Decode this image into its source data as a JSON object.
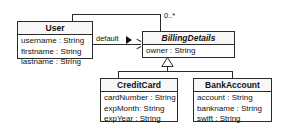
{
  "diagram": {
    "type": "uml-class-diagram",
    "background": "#ffffff",
    "line_color": "#2b2b2b",
    "classes": [
      {
        "id": "user",
        "name": "User",
        "abstract": false,
        "attributes": [
          "username : String",
          "firstname : String",
          "lastname : String"
        ]
      },
      {
        "id": "billingdetails",
        "name": "BillingDetails",
        "abstract": true,
        "attributes": [
          "owner : String"
        ]
      },
      {
        "id": "creditcard",
        "name": "CreditCard",
        "abstract": false,
        "attributes": [
          "cardNumber : String",
          "expMonth: String",
          "expYear : String"
        ]
      },
      {
        "id": "bankaccount",
        "name": "BankAccount",
        "abstract": false,
        "attributes": [
          "account : String",
          "bankname : String",
          "swift : String"
        ]
      }
    ],
    "relationships": {
      "association_label": "default",
      "multiplicity": "0..*",
      "generalization_from": [
        "CreditCard",
        "BankAccount"
      ],
      "generalization_to": "BillingDetails"
    }
  }
}
